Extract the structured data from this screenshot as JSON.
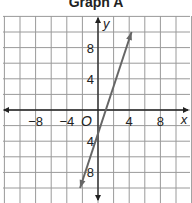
{
  "title": "Graph A",
  "chart_data": {
    "type": "line",
    "title": "Graph A",
    "xlabel": "x",
    "ylabel": "y",
    "origin_label": "O",
    "xlim": [
      -12,
      12
    ],
    "ylim": [
      -12,
      12
    ],
    "grid": true,
    "grid_step": 2,
    "x_ticks": [
      -8,
      -4,
      4,
      8
    ],
    "y_ticks": [
      8,
      4,
      -4,
      -8
    ],
    "x_tick_labels": [
      "−8",
      "−4",
      "4",
      "8"
    ],
    "y_tick_labels": [
      "8",
      "4",
      "4",
      "8"
    ],
    "series": [
      {
        "name": "line",
        "equation": "y = 3x - 3",
        "slope": 3,
        "y_intercept": -3,
        "points": [
          [
            -2.3,
            -10
          ],
          [
            0,
            -3
          ],
          [
            1,
            0
          ],
          [
            4.3,
            10
          ]
        ],
        "arrows": "both ends",
        "color": "#666666"
      }
    ]
  }
}
